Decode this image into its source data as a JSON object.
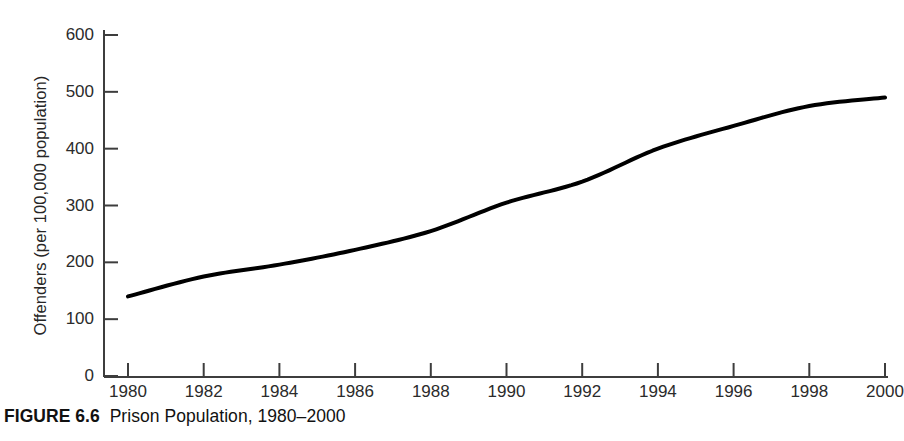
{
  "figure": {
    "caption_label": "FIGURE 6.6",
    "caption_text": "Prison Population, 1980–2000",
    "background_color": "#ffffff",
    "line_color": "#000000",
    "axis_color": "#3d3d3d",
    "text_color": "#2b2b2b"
  },
  "chart_data": {
    "type": "line",
    "title": "Prison Population, 1980–2000",
    "xlabel": "",
    "ylabel": "Offenders (per 100,000 population)",
    "x": [
      1980,
      1982,
      1984,
      1986,
      1988,
      1990,
      1992,
      1994,
      1996,
      1998,
      2000
    ],
    "values": [
      140,
      175,
      196,
      222,
      255,
      305,
      342,
      400,
      440,
      475,
      490
    ],
    "series": [
      {
        "name": "Offenders per 100,000 population",
        "values": [
          140,
          175,
          196,
          222,
          255,
          305,
          342,
          400,
          440,
          475,
          490
        ]
      }
    ],
    "xlim": [
      1980,
      2000
    ],
    "ylim": [
      0,
      600
    ],
    "xticks": [
      1980,
      1982,
      1984,
      1986,
      1988,
      1990,
      1992,
      1994,
      1996,
      1998,
      2000
    ],
    "xticklabels": [
      "1980",
      "1982",
      "1984",
      "1986",
      "1988",
      "1990",
      "1992",
      "1994",
      "1996",
      "1998",
      "2000"
    ],
    "yticks": [
      0,
      100,
      200,
      300,
      400,
      500,
      600
    ],
    "yticklabels": [
      "0",
      "100",
      "200",
      "300",
      "400",
      "500",
      "600"
    ],
    "grid": false,
    "legend": false,
    "legend_position": "none",
    "line_width": 4,
    "annotations": []
  }
}
